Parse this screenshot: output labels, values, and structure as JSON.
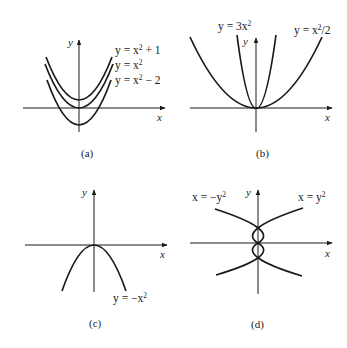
{
  "figure": {
    "panels": [
      {
        "caption": "(a)",
        "x_label": "x",
        "y_label": "y",
        "curves": [
          {
            "label_prefix": "y = x",
            "label_exp": "2",
            "label_suffix": " + 1",
            "equation": "y = x^2 + 1"
          },
          {
            "label_prefix": "y = x",
            "label_exp": "2",
            "label_suffix": "",
            "equation": "y = x^2"
          },
          {
            "label_prefix": "y = x",
            "label_exp": "2",
            "label_suffix": " − 2",
            "equation": "y = x^2 - 2"
          }
        ]
      },
      {
        "caption": "(b)",
        "x_label": "x",
        "y_label": "y",
        "curves": [
          {
            "label_prefix": "y = 3x",
            "label_exp": "2",
            "label_suffix": "",
            "equation": "y = 3x^2"
          },
          {
            "label_prefix": "y = x",
            "label_exp": "2",
            "label_suffix": "/2",
            "equation": "y = x^2/2"
          }
        ]
      },
      {
        "caption": "(c)",
        "x_label": "x",
        "y_label": "y",
        "curves": [
          {
            "label_prefix": "y = −x",
            "label_exp": "2",
            "label_suffix": "",
            "equation": "y = -x^2"
          }
        ]
      },
      {
        "caption": "(d)",
        "x_label": "x",
        "y_label": "y",
        "curves": [
          {
            "label_prefix": "x = −y",
            "label_exp": "2",
            "label_suffix": "",
            "equation": "x = -y^2"
          },
          {
            "label_prefix": "x = y",
            "label_exp": "2",
            "label_suffix": "",
            "equation": "x = y^2"
          }
        ]
      }
    ]
  }
}
